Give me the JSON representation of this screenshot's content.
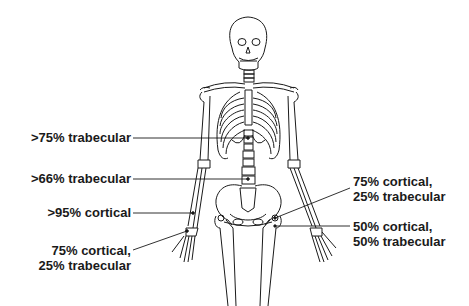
{
  "figure": {
    "line_color": "#1a1a1a",
    "background": "#ffffff"
  },
  "labels": {
    "spine_thoracic": {
      "lines": [
        ">75% trabecular"
      ]
    },
    "spine_lumbar": {
      "lines": [
        ">66% trabecular"
      ]
    },
    "radius_shaft": {
      "lines": [
        ">95% cortical"
      ]
    },
    "distal_radius": {
      "lines": [
        "75% cortical,",
        "25% trabecular"
      ]
    },
    "femoral_neck": {
      "lines": [
        "75% cortical,",
        "25% trabecular"
      ]
    },
    "intertrochanteric": {
      "lines": [
        "50% cortical,",
        "50% trabecular"
      ]
    }
  }
}
